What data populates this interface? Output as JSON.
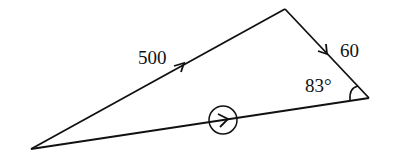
{
  "diagram": {
    "type": "vector-triangle",
    "vertices": {
      "bottom_left": [
        31,
        149
      ],
      "top": [
        285,
        9
      ],
      "right": [
        369,
        98
      ]
    },
    "edges": [
      {
        "id": "air-velocity",
        "from": "bottom_left",
        "to": "top",
        "label": "500",
        "arrow": "single"
      },
      {
        "id": "wind-velocity",
        "from": "top",
        "to": "right",
        "label": "60",
        "arrow": "single"
      },
      {
        "id": "resultant",
        "from": "bottom_left",
        "to": "right",
        "label": "",
        "arrow": "circled"
      }
    ],
    "angle": {
      "at": "right",
      "label": "83°"
    },
    "labels": {
      "edge1": "500",
      "edge2": "60",
      "angle": "83°"
    },
    "colors": {
      "stroke": "#111111",
      "background": "#ffffff"
    }
  }
}
